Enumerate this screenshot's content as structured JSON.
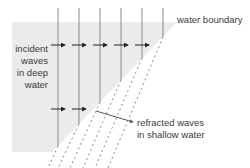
{
  "labels": {
    "water_boundary": "water boundary",
    "incident_line1": "incident",
    "incident_line2": "waves",
    "incident_line3": "in deep",
    "incident_line4": "water",
    "refracted_line1": "refracted waves",
    "refracted_line2": "in shallow water"
  },
  "colors": {
    "deep_water": "#ebebeb",
    "shallow_water": "#ffffff",
    "wave_line": "#8a8a8a",
    "arrow": "#222222",
    "text": "#3a3a3a"
  },
  "geometry": {
    "incident_wave_x": [
      58,
      79,
      100,
      121,
      142
    ],
    "deep_region": {
      "top": 22,
      "left": 12,
      "bottom": 152
    },
    "boundary": {
      "x1": 177,
      "y1": 22,
      "x2": 52,
      "y2": 152
    }
  }
}
